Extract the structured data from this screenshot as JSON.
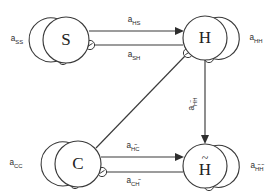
{
  "diagram": {
    "type": "directed-graph",
    "background_color": "#ffffff",
    "stroke_color": "#3a3a3a",
    "label_color": "#2b2b2b",
    "nodes": [
      {
        "id": "S",
        "label": "S",
        "tilde": "",
        "cx": 66,
        "cy": 40,
        "r": 23
      },
      {
        "id": "H",
        "label": "H",
        "tilde": "",
        "cx": 205,
        "cy": 38,
        "r": 22
      },
      {
        "id": "C",
        "label": "C",
        "tilde": "",
        "cx": 78,
        "cy": 164,
        "r": 23
      },
      {
        "id": "Ht",
        "label": "H",
        "tilde": "~",
        "cx": 205,
        "cy": 166,
        "r": 22
      }
    ],
    "self_loops": [
      {
        "id": "loop-ss",
        "node": "S",
        "label_base": "a",
        "label_sub": "SS",
        "sub_tilde": "",
        "label_x": 17,
        "label_y": 39,
        "side": "left"
      },
      {
        "id": "loop-hh",
        "node": "H",
        "label_base": "a",
        "label_sub": "HH",
        "sub_tilde": "",
        "label_x": 256,
        "label_y": 38,
        "side": "right"
      },
      {
        "id": "loop-cc",
        "node": "C",
        "label_base": "a",
        "label_sub": "CC",
        "sub_tilde": "",
        "label_x": 16,
        "label_y": 163,
        "side": "left"
      },
      {
        "id": "loop-htht",
        "node": "Ht",
        "label_base": "a",
        "label_sub": "HH",
        "sub_tilde": "both",
        "label_x": 257,
        "label_y": 166,
        "side": "right"
      }
    ],
    "edges": [
      {
        "id": "edge-s-h",
        "from": "S",
        "to": "H",
        "endpoint": "arrow",
        "label_base": "a",
        "label_sub": "HS",
        "sub_tilde": "",
        "label_x": 134,
        "label_y": 20
      },
      {
        "id": "edge-h-s",
        "from": "H",
        "to": "S",
        "endpoint": "inhibitor",
        "label_base": "a",
        "label_sub": "SH",
        "sub_tilde": "",
        "label_x": 134,
        "label_y": 55
      },
      {
        "id": "edge-c-ht",
        "from": "C",
        "to": "Ht",
        "endpoint": "arrow",
        "label_base": "a",
        "label_sub": "HC",
        "sub_tilde": "first",
        "label_x": 133,
        "label_y": 146
      },
      {
        "id": "edge-ht-c",
        "from": "Ht",
        "to": "C",
        "endpoint": "inhibitor",
        "label_base": "a",
        "label_sub": "CH",
        "sub_tilde": "last",
        "label_x": 133,
        "label_y": 181
      },
      {
        "id": "edge-h-ht",
        "from": "H",
        "to": "Ht",
        "endpoint": "arrow",
        "label_base": "a",
        "label_sub": "HH",
        "sub_tilde": "first",
        "label_x": 192,
        "label_y": 104,
        "orientation": "vertical"
      },
      {
        "id": "edge-h-c",
        "from": "H",
        "to": "C",
        "endpoint": "inhibitor",
        "label_base": "",
        "label_sub": "",
        "sub_tilde": "",
        "label_x": 0,
        "label_y": 0,
        "orientation": "diagonal"
      }
    ]
  }
}
